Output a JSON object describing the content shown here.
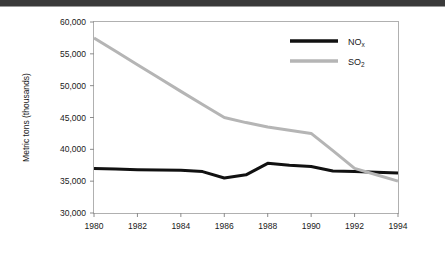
{
  "figure": {
    "background_color": "#ffffff",
    "header_bar_color": "#3a3a3a",
    "frame_color": "#b0b0b0"
  },
  "axes": {
    "y_axis_title": "Metric tons (thousands)",
    "y_tick_labels": [
      "30,000",
      "35,000",
      "40,000",
      "45,000",
      "50,000",
      "55,000",
      "60,000"
    ],
    "x_tick_labels": [
      "1980",
      "1982",
      "1984",
      "1986",
      "1988",
      "1990",
      "1992",
      "1994"
    ]
  },
  "legend": {
    "position": "top-right",
    "entries": [
      {
        "name": "nox",
        "base": "NO",
        "sub": "x",
        "color": "#111111"
      },
      {
        "name": "so2",
        "base": "SO",
        "sub": "2",
        "color": "#b5b5b5"
      }
    ]
  },
  "chart_data": {
    "type": "line",
    "title": "",
    "subtitle": "",
    "xlabel": "",
    "ylabel": "Metric tons (thousands)",
    "xlim": [
      1980,
      1994
    ],
    "ylim": [
      30000,
      60000
    ],
    "y_ticks": [
      30000,
      35000,
      40000,
      45000,
      50000,
      55000,
      60000
    ],
    "x_ticks": [
      1980,
      1982,
      1984,
      1986,
      1988,
      1990,
      1992,
      1994
    ],
    "grid": false,
    "legend_position": "top-right",
    "x": [
      1980,
      1981,
      1982,
      1983,
      1984,
      1985,
      1986,
      1987,
      1988,
      1989,
      1990,
      1991,
      1992,
      1993,
      1994
    ],
    "series": [
      {
        "name": "NOx",
        "display_name": "NOₓ",
        "color": "#111111",
        "line_width": 3,
        "values": [
          37000,
          36900,
          36800,
          36750,
          36700,
          36500,
          35500,
          36000,
          37800,
          37500,
          37300,
          36600,
          36500,
          36400,
          36300
        ]
      },
      {
        "name": "SO2",
        "display_name": "SO₂",
        "color": "#b5b5b5",
        "line_width": 3,
        "values": [
          57500,
          55400,
          53300,
          51200,
          49100,
          47050,
          45000,
          44200,
          43500,
          43000,
          42500,
          39800,
          37000,
          36000,
          35000
        ]
      }
    ]
  }
}
